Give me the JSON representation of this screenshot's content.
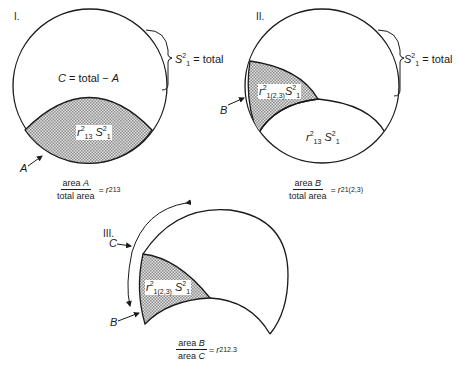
{
  "panels": [
    {
      "id": "I",
      "numeral": "I.",
      "region_label": "C = total − A",
      "region_c": "C",
      "region_c_rest": " = total − ",
      "region_a": "A",
      "shaded_label": {
        "r": "r",
        "r_sup": "2",
        "r_sub": "13",
        "s": "S",
        "s_sup": "2",
        "s_sub": "1"
      },
      "brace_label": {
        "s": "S",
        "s_sup": "2",
        "s_sub": "1",
        "rest": " = total"
      },
      "arrow_label": "A",
      "formula": {
        "numerator_word": "area ",
        "numerator_var": "A",
        "denominator": "total area",
        "equals": "=",
        "r": "r",
        "r_sup": "2",
        "r_sub": "13"
      }
    },
    {
      "id": "II",
      "numeral": "II.",
      "shaded_label": {
        "r": "r",
        "r_sup": "2",
        "r_sub": "1(2,3)",
        "s": "S",
        "s_sup": "2",
        "s_sub": "1"
      },
      "lower_label": {
        "r": "r",
        "r_sup": "2",
        "r_sub": "13",
        "s": "S",
        "s_sup": "2",
        "s_sub": "1"
      },
      "brace_label": {
        "s": "S",
        "s_sup": "2",
        "s_sub": "1",
        "rest": " = total"
      },
      "arrow_label": "B",
      "formula": {
        "numerator_word": "area ",
        "numerator_var": "B",
        "denominator": "total area",
        "equals": "=",
        "r": "r",
        "r_sup": "2",
        "r_sub": "1(2,3)"
      }
    },
    {
      "id": "III",
      "numeral": "III.",
      "shaded_label": {
        "r": "r",
        "r_sup": "2",
        "r_sub": "1(2,3)",
        "s": "S",
        "s_sup": "2",
        "s_sub": "1"
      },
      "arrow_label_c": "C",
      "arrow_label_b": "B",
      "formula": {
        "numerator_word": "area ",
        "numerator_var": "B",
        "denominator_word": "area ",
        "denominator_var": "C",
        "equals": "=",
        "r": "r",
        "r_sup": "2",
        "r_sub": "12.3"
      }
    }
  ],
  "colors": {
    "stroke": "#1a1a1a",
    "shade": "#c8c8c8",
    "background": "#ffffff"
  }
}
